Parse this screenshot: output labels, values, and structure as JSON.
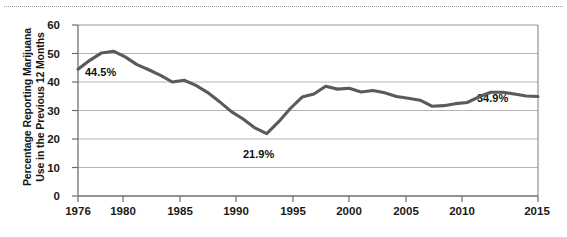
{
  "chart_data": {
    "type": "line",
    "title": "",
    "subtitle": "",
    "xlabel": "",
    "ylabel": "Percentage Reporting Marijuana Use in the Previous 12 Months",
    "ylabel_lines": [
      "Percentage Reporting Marijuana",
      "Use in the Previous 12 Months"
    ],
    "xlim": [
      1976,
      2015
    ],
    "ylim": [
      0,
      60
    ],
    "grid": true,
    "grid_axis": "y",
    "legend": false,
    "legend_position": "none",
    "line_color": "#5a5a5a",
    "axis_color": "#808080",
    "x": [
      1976,
      1977,
      1978,
      1979,
      1980,
      1981,
      1982,
      1983,
      1984,
      1985,
      1986,
      1987,
      1988,
      1989,
      1990,
      1991,
      1992,
      1993,
      1994,
      1995,
      1996,
      1997,
      1998,
      1999,
      2000,
      2001,
      2002,
      2003,
      2004,
      2005,
      2006,
      2007,
      2008,
      2009,
      2010,
      2011,
      2012,
      2013,
      2014,
      2015
    ],
    "values": [
      44.5,
      47.6,
      50.2,
      50.8,
      48.8,
      46.1,
      44.3,
      42.3,
      40.0,
      40.6,
      38.8,
      36.3,
      33.1,
      29.6,
      27.0,
      23.9,
      21.9,
      26.0,
      30.7,
      34.7,
      35.8,
      38.5,
      37.5,
      37.8,
      36.5,
      37.0,
      36.2,
      34.9,
      34.3,
      33.6,
      31.5,
      31.7,
      32.4,
      32.8,
      34.8,
      36.4,
      36.4,
      35.8,
      35.1,
      34.9
    ],
    "y_ticks": [
      0,
      10,
      20,
      30,
      40,
      50,
      60
    ],
    "y_tick_labels": [
      "0",
      "10",
      "20",
      "30",
      "40",
      "50",
      "60"
    ],
    "x_ticks": [
      1976,
      1980,
      1985,
      1990,
      1995,
      2000,
      2005,
      2010,
      2015
    ],
    "x_tick_labels": [
      "1976",
      "1980",
      "1985",
      "1990",
      "1995",
      "2000",
      "2005",
      "2010",
      "2015"
    ],
    "annotations": [
      {
        "label": "44.5%",
        "x": 1976,
        "y": 44.5
      },
      {
        "label": "21.9%",
        "x": 1992,
        "y": 21.9
      },
      {
        "label": "34.9%",
        "x": 2015,
        "y": 34.9
      }
    ]
  }
}
